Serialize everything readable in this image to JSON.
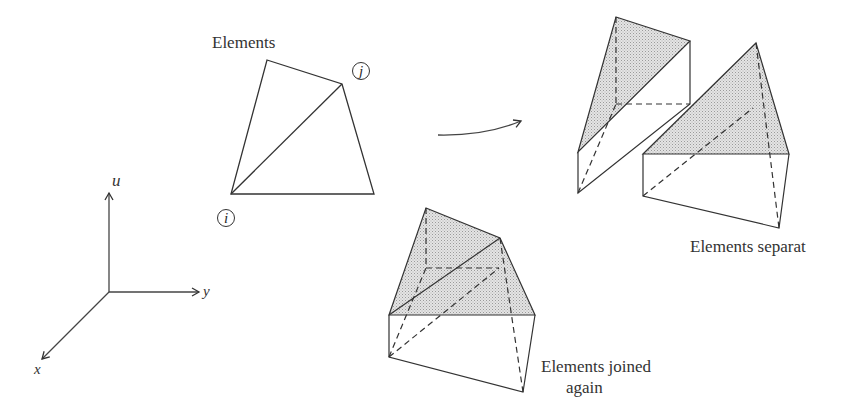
{
  "figure": {
    "type": "finite-element discretization illustration",
    "stroke_color": "#333333",
    "fill_color": "#d8d8d8"
  },
  "axes": {
    "u_label": "u",
    "y_label": "y",
    "x_label": "x"
  },
  "flat_mesh": {
    "title": "Elements",
    "node_j": "j",
    "node_i": "i"
  },
  "separated": {
    "caption": "Elements separat"
  },
  "joined": {
    "caption_line1": "Elements joined",
    "caption_line2": "again"
  }
}
